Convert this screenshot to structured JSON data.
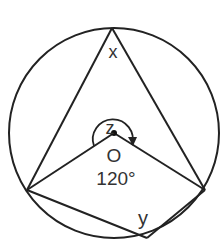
{
  "diagram": {
    "type": "circle-geometry",
    "colors": {
      "stroke": "#222222",
      "text": "#333333",
      "background": "#ffffff"
    },
    "circle": {
      "cx": 114,
      "cy": 133,
      "r": 105
    },
    "points": {
      "top": {
        "x": 112,
        "y": 28
      },
      "left": {
        "x": 27,
        "y": 190
      },
      "right": {
        "x": 205,
        "y": 190
      },
      "bottom": {
        "x": 147,
        "y": 238
      },
      "centre": {
        "x": 114,
        "y": 133
      }
    },
    "labels": {
      "x": "x",
      "z": "z",
      "centre": "O",
      "angle": "120°",
      "y": "y"
    }
  }
}
